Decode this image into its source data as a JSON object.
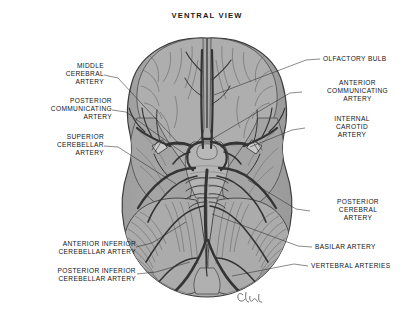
{
  "figure": {
    "title": "VENTRAL VIEW",
    "signature": "clw",
    "colors": {
      "background": "#ffffff",
      "brain_tissue": "#a9a9a9",
      "brain_tissue_light": "#c2c2c2",
      "brain_tissue_dark": "#8e8e8e",
      "artery": "#3a3a3a",
      "outline": "#2b2b2b",
      "text": "#141414",
      "leader_line": "#2b2b2b"
    }
  },
  "labels": {
    "left": [
      {
        "id": "middle-cerebral-artery",
        "text": "MIDDLE\nCEREBRAL\nARTERY"
      },
      {
        "id": "posterior-communicating-artery",
        "text": "POSTERIOR\nCOMMUNICATING\nARTERY"
      },
      {
        "id": "superior-cerebellar-artery",
        "text": "SUPERIOR\nCEREBELLAR\nARTERY"
      },
      {
        "id": "anterior-inferior-cerebellar-artery",
        "text": "ANTERIOR INFERIOR\nCEREBELLAR ARTERY"
      },
      {
        "id": "posterior-inferior-cerebellar-artery",
        "text": "POSTERIOR INFERIOR\nCEREBELLAR ARTERY"
      }
    ],
    "right": [
      {
        "id": "olfactory-bulb",
        "text": "OLFACTORY BULB"
      },
      {
        "id": "anterior-communicating-artery",
        "text": "ANTERIOR\nCOMMUNICATING\nARTERY"
      },
      {
        "id": "internal-carotid-artery",
        "text": "INTERNAL\nCAROTID\nARTERY"
      },
      {
        "id": "posterior-cerebral-artery",
        "text": "POSTERIOR\nCEREBRAL\nARTERY"
      },
      {
        "id": "basilar-artery",
        "text": "BASILAR ARTERY"
      },
      {
        "id": "vertebral-arteries",
        "text": "VERTEBRAL ARTERIES"
      }
    ]
  }
}
